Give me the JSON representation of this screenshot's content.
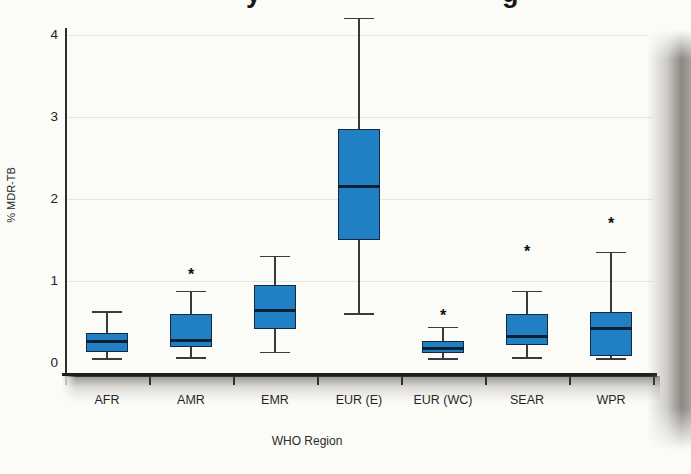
{
  "title_fragments": [
    "y",
    "g"
  ],
  "chart_data": {
    "type": "boxplot",
    "xlabel": "WHO Region",
    "ylabel": "% MDR-TB",
    "ylim": [
      0,
      4.3
    ],
    "yticks": [
      0,
      1,
      2,
      3,
      4
    ],
    "grid": true,
    "outlier_marker": "*",
    "categories": [
      "AFR",
      "AMR",
      "EMR",
      "EUR (E)",
      "EUR (WC)",
      "SEAR",
      "WPR"
    ],
    "series": [
      {
        "category": "AFR",
        "min": 0.05,
        "q1": 0.14,
        "median": 0.26,
        "q3": 0.36,
        "max": 0.62,
        "outliers": []
      },
      {
        "category": "AMR",
        "min": 0.06,
        "q1": 0.19,
        "median": 0.27,
        "q3": 0.6,
        "max": 0.87,
        "outliers": [
          1.08
        ]
      },
      {
        "category": "EMR",
        "min": 0.13,
        "q1": 0.41,
        "median": 0.64,
        "q3": 0.95,
        "max": 1.3,
        "outliers": []
      },
      {
        "category": "EUR (E)",
        "min": 0.6,
        "q1": 1.5,
        "median": 2.15,
        "q3": 2.85,
        "max": 4.2,
        "outliers": []
      },
      {
        "category": "EUR (WC)",
        "min": 0.05,
        "q1": 0.12,
        "median": 0.18,
        "q3": 0.27,
        "max": 0.43,
        "outliers": [
          0.59
        ]
      },
      {
        "category": "SEAR",
        "min": 0.06,
        "q1": 0.22,
        "median": 0.32,
        "q3": 0.6,
        "max": 0.87,
        "outliers": [
          1.36
        ]
      },
      {
        "category": "WPR",
        "min": 0.05,
        "q1": 0.08,
        "median": 0.42,
        "q3": 0.62,
        "max": 1.35,
        "outliers": [
          1.71
        ]
      }
    ],
    "colors": {
      "box_fill": "#2180c4",
      "box_border": "#14293f",
      "median_line": "#0c2033",
      "whisker": "#3a3a3a"
    }
  }
}
